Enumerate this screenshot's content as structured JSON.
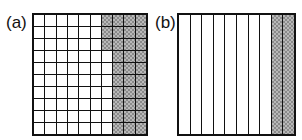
{
  "panels": [
    {
      "label": "(a)",
      "type": "grid",
      "rows": 10,
      "cols": 10,
      "shaded_per_row": [
        4,
        4,
        4,
        3,
        3,
        3,
        3,
        3,
        3,
        3
      ],
      "shaded_total": 33,
      "total_cells": 100
    },
    {
      "label": "(b)",
      "type": "strips",
      "rows": 1,
      "cols": 10,
      "shaded_per_row": [
        2
      ],
      "shaded_total": 2,
      "total_cells": 10
    }
  ],
  "colors": {
    "line": "#111111",
    "shade_light": "#b8b8b8",
    "shade_dark": "#8a8a8a",
    "background": "#ffffff"
  }
}
